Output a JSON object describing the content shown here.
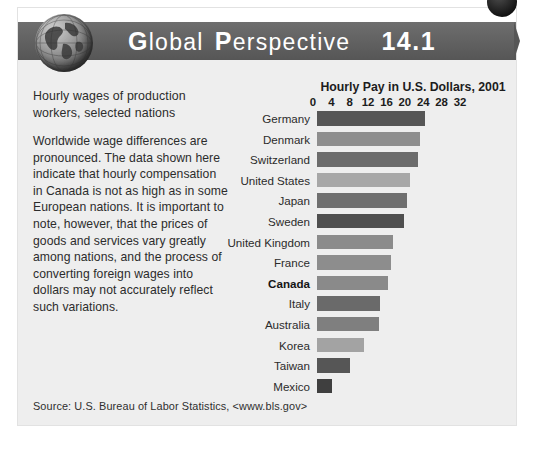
{
  "header": {
    "title_word1": "Global",
    "title_word1_cap": "G",
    "title_word1_rest": "lobal",
    "title_word2_cap": "P",
    "title_word2_rest": "erspective",
    "number": "14.1",
    "globe_icon": "globe-icon",
    "corner_badge": "corner-circle-badge",
    "band_color": "#636363"
  },
  "left": {
    "lede": "Hourly wages of production workers, selected nations",
    "body": "Worldwide wage differences are pronounced. The data shown here indicate that hourly compensation in Canada is not as high as in some European nations. It is important to note, however, that the prices of goods and services vary greatly among nations, and the process of converting foreign wages into dollars may not accurately reflect such variations."
  },
  "source": "Source: U.S. Bureau of Labor Statistics, <www.bls.gov>",
  "chart_data": {
    "type": "bar",
    "orientation": "horizontal",
    "title": "Hourly Pay in U.S. Dollars, 2001",
    "xlabel": "",
    "ylabel": "",
    "xlim": [
      0,
      32
    ],
    "xticks": [
      0,
      4,
      8,
      12,
      16,
      20,
      24,
      28,
      32
    ],
    "grid": false,
    "legend": false,
    "highlight_category": "Canada",
    "categories": [
      "Germany",
      "Denmark",
      "Switzerland",
      "United States",
      "Japan",
      "Sweden",
      "United Kingdom",
      "France",
      "Canada",
      "Italy",
      "Australia",
      "Korea",
      "Taiwan",
      "Mexico"
    ],
    "values": [
      23.5,
      22.5,
      22.0,
      20.3,
      19.5,
      19.0,
      16.5,
      16.2,
      15.5,
      13.8,
      13.5,
      10.2,
      7.2,
      3.2
    ],
    "bar_colors": [
      "#565656",
      "#8e8e8e",
      "#6c6c6c",
      "#a7a7a7",
      "#6f6f6f",
      "#4f4f4f",
      "#8b8b8b",
      "#8d8d8d",
      "#8a8a8a",
      "#6a6a6a",
      "#7f7f7f",
      "#a3a3a3",
      "#565656",
      "#3f3f3f"
    ]
  }
}
